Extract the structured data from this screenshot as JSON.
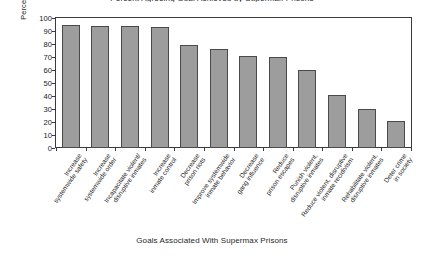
{
  "chart_data": {
    "type": "bar",
    "title": "Percent Agreeing Goal Achieved by Supermax Prisons",
    "xlabel": "Goals Associated With Supermax Prisons",
    "ylabel": "Percent Agreeing Goal Achieved",
    "ylim": [
      0,
      100
    ],
    "ytick_step": 10,
    "yticks": [
      100,
      90,
      80,
      70,
      60,
      50,
      40,
      30,
      20,
      10,
      0
    ],
    "grid": false,
    "legend": "none",
    "bar_color": "#9d9d9d",
    "bar_edge_color": "#4a4a4a",
    "categories": [
      "Increase\nsystemwide safety",
      "Increase\nsystemwide order",
      "Incapacitate violent/\ndisruptive inmates",
      "Increase\ninmate control",
      "Decrease\nprison riots",
      "Improve systemwide\ninmate behavior",
      "Decrease\ngang influence",
      "Reduce\nprison escapes",
      "Punish violent,\ndisruptive inmates",
      "Reduce violent, disruptive\ninmate recidivism",
      "Rehabilitate violent,\ndisruptive inmates",
      "Deter crime\nin society"
    ],
    "values": [
      95,
      94,
      94,
      93,
      79,
      76,
      71,
      70,
      60,
      41,
      30,
      21
    ]
  }
}
